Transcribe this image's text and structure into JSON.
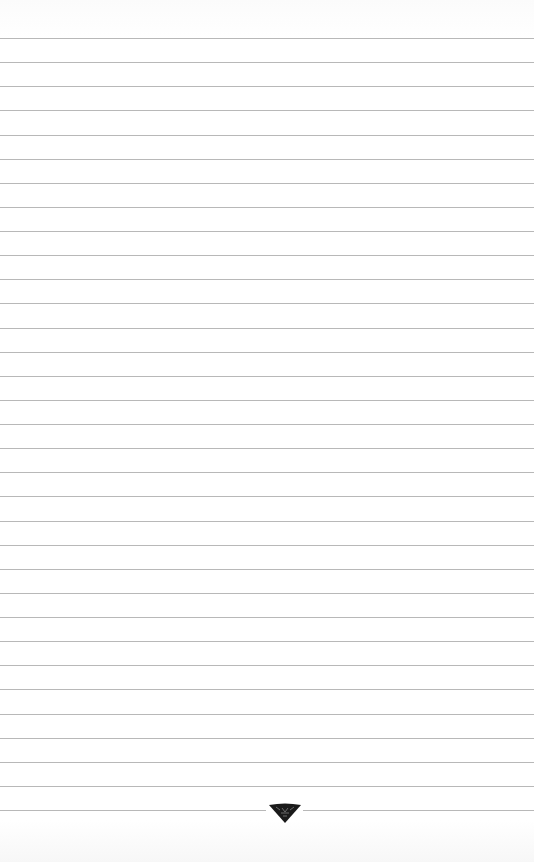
{
  "page": {
    "type": "ruled-paper",
    "line_count": 33,
    "first_line_y": 38,
    "line_spacing": 24.125,
    "line_color": "#b8b8b8",
    "background": "#ffffff"
  },
  "controls": {
    "scroll_down": {
      "icon": "chevron-down-icon",
      "color": "#1a1a1a"
    }
  }
}
